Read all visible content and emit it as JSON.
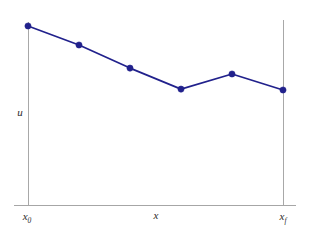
{
  "chart_data": {
    "type": "line",
    "title": "",
    "subtitle": "",
    "xlabel": "x",
    "ylabel": "u",
    "grid": false,
    "legend": null,
    "series": [
      {
        "name": "u",
        "color": "#21218c",
        "marker": "circle",
        "x": [
          0,
          1,
          2,
          3,
          4,
          5
        ],
        "values": [
          1.0,
          0.894,
          0.765,
          0.648,
          0.732,
          0.643
        ]
      }
    ],
    "x_axis": {
      "start_label": "x",
      "start_label_sub": "0",
      "end_label": "x",
      "end_label_sub": "f",
      "center_label": "x",
      "xlim": [
        0,
        5
      ],
      "ticks": []
    },
    "y_axis": {
      "label": "u",
      "ylim": [
        0,
        1.12
      ],
      "ticks": []
    },
    "annotations": [],
    "boundary_lines": [
      "x0-vertical",
      "xf-vertical"
    ]
  },
  "labels": {
    "y_axis_label": "u",
    "x_axis_label": "x",
    "x_start_base": "x",
    "x_start_sub": "0",
    "x_end_base": "x",
    "x_end_sub": "f"
  },
  "colors": {
    "series": "#21218c",
    "axis": "#a6a6a6",
    "background": "#ffffff",
    "text": "#2b2b2b"
  }
}
